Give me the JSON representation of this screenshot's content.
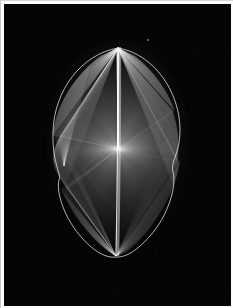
{
  "document": {
    "kind": "scanned-plate",
    "page_background": "#fdfdfd",
    "plate_background": "#050505",
    "width_px": 233,
    "height_px": 308
  },
  "plate": {
    "name": "line-art-plate",
    "margin_px": 4,
    "border_color": "#c9c9c9"
  },
  "figure": {
    "type": "string-art-ruled-surface",
    "stroke_color": "#e8e8e8",
    "accent_color": "#ffffff",
    "dim_color": "#8a8a8a",
    "bounds": {
      "left": 52,
      "top": 47,
      "right": 180,
      "bottom": 258
    },
    "axis_x": 118,
    "apex": {
      "x": 118,
      "y": 48
    },
    "node": {
      "x": 118,
      "y": 149
    },
    "cusp": {
      "x": 116,
      "y": 256
    },
    "left_cusp": {
      "x": 58,
      "y": 176
    },
    "right_cusp": {
      "x": 172,
      "y": 140
    },
    "line_count": 220
  },
  "chart_data": {
    "type": "scatter",
    "title": "",
    "xlabel": "",
    "ylabel": "",
    "grid": false,
    "legend": "none",
    "xlim": [
      52,
      180
    ],
    "ylim": [
      47,
      258
    ],
    "annotations": []
  },
  "speck": {
    "name": "emulsion-speck",
    "x": 143,
    "y": 35
  }
}
